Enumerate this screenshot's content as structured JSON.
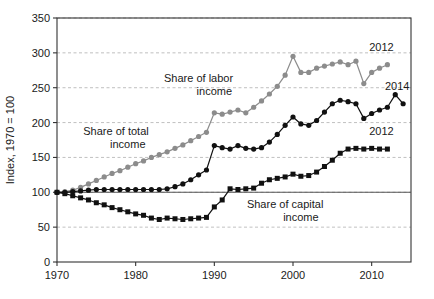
{
  "chart_data": {
    "type": "line",
    "title": "",
    "xlabel": "",
    "ylabel": "Index, 1970 = 100",
    "xlim": [
      1970,
      2015
    ],
    "ylim": [
      0,
      350
    ],
    "ytick_values": [
      0,
      50,
      100,
      150,
      200,
      250,
      300,
      350
    ],
    "ytick_labels": [
      "0",
      "50",
      "100",
      "150",
      "200",
      "250",
      "300",
      "350"
    ],
    "xtick_values": [
      1970,
      1980,
      1990,
      2000,
      2010
    ],
    "xtick_labels": [
      "1970",
      "1980",
      "1990",
      "2000",
      "2010"
    ],
    "grid": "horizontal-dashed",
    "legend_position": "inline-annotations",
    "reference_line": {
      "value": 100,
      "style": "solid",
      "color": "#555555"
    },
    "series": [
      {
        "name": "Share of labor income",
        "color": "#8c8c8c",
        "marker": "circle",
        "end_label": "2012",
        "x": [
          1970,
          1971,
          1972,
          1973,
          1974,
          1975,
          1976,
          1977,
          1978,
          1979,
          1980,
          1981,
          1982,
          1983,
          1984,
          1985,
          1986,
          1987,
          1988,
          1989,
          1990,
          1991,
          1992,
          1993,
          1994,
          1995,
          1996,
          1997,
          1998,
          1999,
          2000,
          2001,
          2002,
          2003,
          2004,
          2005,
          2006,
          2007,
          2008,
          2009,
          2010,
          2011,
          2012
        ],
        "y": [
          100,
          101,
          103,
          107,
          112,
          117,
          122,
          127,
          131,
          136,
          141,
          145,
          150,
          154,
          158,
          163,
          168,
          174,
          180,
          186,
          214,
          212,
          215,
          218,
          214,
          222,
          231,
          241,
          252,
          268,
          295,
          272,
          272,
          278,
          281,
          284,
          287,
          283,
          288,
          256,
          272,
          278,
          283
        ]
      },
      {
        "name": "Share of total income",
        "color": "#111111",
        "marker": "circle",
        "end_label": "2014",
        "x": [
          1970,
          1971,
          1972,
          1973,
          1974,
          1975,
          1976,
          1977,
          1978,
          1979,
          1980,
          1981,
          1982,
          1983,
          1984,
          1985,
          1986,
          1987,
          1988,
          1989,
          1990,
          1991,
          1992,
          1993,
          1994,
          1995,
          1996,
          1997,
          1998,
          1999,
          2000,
          2001,
          2002,
          2003,
          2004,
          2005,
          2006,
          2007,
          2008,
          2009,
          2010,
          2011,
          2012,
          2013,
          2014
        ],
        "y": [
          100,
          100,
          101,
          102,
          103,
          104,
          104,
          104,
          104,
          104,
          104,
          104,
          104,
          104,
          105,
          108,
          112,
          118,
          125,
          132,
          167,
          164,
          162,
          167,
          163,
          162,
          164,
          172,
          183,
          196,
          208,
          198,
          196,
          203,
          215,
          227,
          232,
          230,
          227,
          206,
          213,
          218,
          222,
          240,
          227
        ]
      },
      {
        "name": "Share of capital income",
        "color": "#111111",
        "marker": "square",
        "end_label": "2012",
        "x": [
          1970,
          1971,
          1972,
          1973,
          1974,
          1975,
          1976,
          1977,
          1978,
          1979,
          1980,
          1981,
          1982,
          1983,
          1984,
          1985,
          1986,
          1987,
          1988,
          1989,
          1990,
          1991,
          1992,
          1993,
          1994,
          1995,
          1996,
          1997,
          1998,
          1999,
          2000,
          2001,
          2002,
          2003,
          2004,
          2005,
          2006,
          2007,
          2008,
          2009,
          2010,
          2011,
          2012
        ],
        "y": [
          100,
          98,
          95,
          92,
          89,
          85,
          82,
          78,
          75,
          72,
          69,
          67,
          63,
          61,
          63,
          62,
          61,
          62,
          63,
          64,
          79,
          89,
          105,
          104,
          105,
          106,
          113,
          118,
          120,
          122,
          126,
          123,
          124,
          129,
          137,
          146,
          156,
          162,
          163,
          162,
          163,
          162,
          162
        ]
      }
    ],
    "annotations": [
      {
        "text": "Share of labor",
        "x": 1988,
        "y": 258
      },
      {
        "text": "income",
        "x": 1990,
        "y": 240
      },
      {
        "text": "Share of total",
        "x": 1977.5,
        "y": 182
      },
      {
        "text": "income",
        "x": 1979,
        "y": 164
      },
      {
        "text": "Share of capital",
        "x": 1999,
        "y": 77
      },
      {
        "text": "income",
        "x": 2001,
        "y": 59
      }
    ]
  }
}
